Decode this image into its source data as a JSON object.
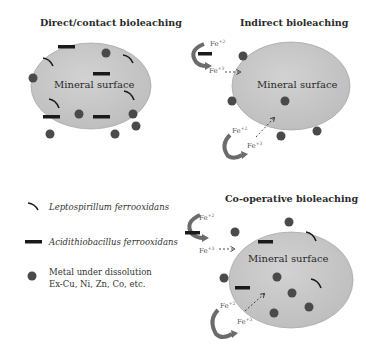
{
  "panels": {
    "direct": {
      "title": "Direct/contact bioleaching",
      "surface_label": "Mineral surface"
    },
    "indirect": {
      "title": "Indirect bioleaching",
      "surface_label": "Mineral surface"
    },
    "cooperative": {
      "title": "Co-operative bioleaching",
      "surface_label": "Mineral surface"
    }
  },
  "ions": {
    "fe2": "Fe",
    "fe2_charge": "+2",
    "fe3": "Fe",
    "fe3_charge": "+3"
  },
  "legend": {
    "items": [
      {
        "symbol": "curved-bacterium",
        "label": "Leptospirillum ferrooxidans"
      },
      {
        "symbol": "rod-bacterium",
        "label": "Acidithiobacillus ferrooxidans"
      },
      {
        "symbol": "metal-dot",
        "label": "Metal under dissolution",
        "sublabel": "Ex-Cu, Ni, Zn, Co, etc."
      }
    ]
  },
  "colors": {
    "mineral_fill": "#c8c8c8",
    "mineral_stroke": "#a8a8a8",
    "dot": "#4a4a4a",
    "bacterium": "#1a1a1a",
    "cycle_arrow": "#6b6b6b"
  }
}
